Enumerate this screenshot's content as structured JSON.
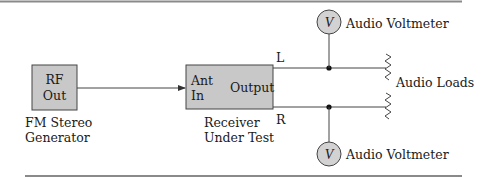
{
  "colors": {
    "box_fill": "#c8c8c8",
    "stroke": "#444444",
    "rule": "#8a8a8a",
    "text": "#1a1a1a"
  },
  "generator": {
    "box_line1": "RF",
    "box_line2": "Out",
    "caption_line1": "FM Stereo",
    "caption_line2": "Generator"
  },
  "receiver": {
    "input_line1": "Ant",
    "input_line2": "In",
    "output_label": "Output",
    "caption_line1": "Receiver",
    "caption_line2": "Under Test"
  },
  "channels": {
    "left": "L",
    "right": "R"
  },
  "voltmeters": {
    "top": {
      "glyph": "V",
      "label": "Audio Voltmeter"
    },
    "bottom": {
      "glyph": "V",
      "label": "Audio Voltmeter"
    }
  },
  "loads": {
    "label": "Audio Loads"
  }
}
